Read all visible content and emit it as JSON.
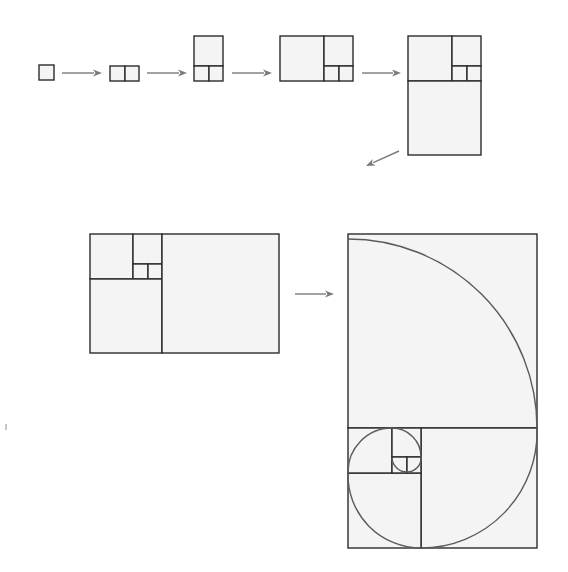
{
  "diagram": {
    "colors": {
      "fill": "#f4f4f4",
      "stroke": "#2b2b2b",
      "arrow": "#7a7a7a",
      "spiral": "#5a5a5a"
    },
    "unit_px": 14.9,
    "stages": [
      {
        "id": "stage-1",
        "label": "1x1",
        "squares": [
          {
            "x": 39,
            "y": 65,
            "w": 15,
            "h": 15
          }
        ]
      },
      {
        "id": "stage-2",
        "label": "1x2",
        "squares": [
          {
            "x": 110,
            "y": 66,
            "w": 15,
            "h": 15
          },
          {
            "x": 125,
            "y": 66,
            "w": 14,
            "h": 15
          }
        ]
      },
      {
        "id": "stage-3",
        "label": "2x3",
        "squares": [
          {
            "x": 194,
            "y": 36,
            "w": 29,
            "h": 30
          },
          {
            "x": 194,
            "y": 66,
            "w": 15,
            "h": 15
          },
          {
            "x": 209,
            "y": 66,
            "w": 14,
            "h": 15
          }
        ]
      },
      {
        "id": "stage-4",
        "label": "3x5",
        "squares": [
          {
            "x": 280,
            "y": 36,
            "w": 44,
            "h": 45
          },
          {
            "x": 324,
            "y": 36,
            "w": 29,
            "h": 30
          },
          {
            "x": 324,
            "y": 66,
            "w": 15,
            "h": 15
          },
          {
            "x": 339,
            "y": 66,
            "w": 14,
            "h": 15
          }
        ]
      },
      {
        "id": "stage-5",
        "label": "5x8",
        "squares": [
          {
            "x": 408,
            "y": 36,
            "w": 44,
            "h": 45
          },
          {
            "x": 452,
            "y": 36,
            "w": 29,
            "h": 30
          },
          {
            "x": 452,
            "y": 66,
            "w": 15,
            "h": 15
          },
          {
            "x": 467,
            "y": 66,
            "w": 14,
            "h": 15
          },
          {
            "x": 408,
            "y": 81,
            "w": 73,
            "h": 74
          }
        ]
      },
      {
        "id": "stage-6",
        "label": "8x13",
        "squares": [
          {
            "x": 90,
            "y": 234,
            "w": 43,
            "h": 45
          },
          {
            "x": 133,
            "y": 234,
            "w": 29,
            "h": 30
          },
          {
            "x": 133,
            "y": 264,
            "w": 15,
            "h": 15
          },
          {
            "x": 148,
            "y": 264,
            "w": 14,
            "h": 15
          },
          {
            "x": 90,
            "y": 279,
            "w": 72,
            "h": 74
          },
          {
            "x": 162,
            "y": 234,
            "w": 117,
            "h": 119
          }
        ]
      },
      {
        "id": "stage-7",
        "label": "13x21 with golden spiral",
        "squares": [
          {
            "x": 348,
            "y": 234,
            "w": 189,
            "h": 194
          },
          {
            "x": 421,
            "y": 428,
            "w": 116,
            "h": 120
          },
          {
            "x": 348,
            "y": 473,
            "w": 73,
            "h": 75
          },
          {
            "x": 348,
            "y": 428,
            "w": 44,
            "h": 45
          },
          {
            "x": 392,
            "y": 428,
            "w": 29,
            "h": 29
          },
          {
            "x": 392,
            "y": 457,
            "w": 15,
            "h": 16
          },
          {
            "x": 407,
            "y": 457,
            "w": 14,
            "h": 16
          }
        ],
        "spiral": [
          {
            "cx": 348,
            "cy": 428,
            "r": 189,
            "from": "top",
            "to": "right",
            "sx": 348,
            "sy": 239,
            "ex": 537,
            "ey": 428
          },
          {
            "cx": 421,
            "cy": 428,
            "r": 116,
            "from": "right",
            "to": "bottom",
            "sx": 537,
            "sy": 428,
            "ex": 421,
            "ey": 548
          },
          {
            "cx": 421,
            "cy": 473,
            "r": 73,
            "from": "bottom",
            "to": "left",
            "sx": 421,
            "sy": 548,
            "ex": 348,
            "ey": 473
          },
          {
            "cx": 392,
            "cy": 473,
            "r": 44,
            "from": "left",
            "to": "top",
            "sx": 348,
            "sy": 473,
            "ex": 392,
            "ey": 428
          },
          {
            "cx": 392,
            "cy": 457,
            "r": 29,
            "from": "top",
            "to": "right",
            "sx": 392,
            "sy": 428,
            "ex": 421,
            "ey": 457
          },
          {
            "cx": 407,
            "cy": 457,
            "r": 14,
            "from": "right",
            "to": "bottom",
            "sx": 421,
            "sy": 457,
            "ex": 407,
            "ey": 472
          },
          {
            "cx": 407,
            "cy": 458,
            "r": 15,
            "from": "bottom",
            "to": "left",
            "sx": 407,
            "sy": 473,
            "ex": 392,
            "ey": 458
          }
        ]
      }
    ],
    "arrows": [
      {
        "id": "arrow-1-2",
        "x1": 62,
        "y1": 73,
        "x2": 102,
        "y2": 73
      },
      {
        "id": "arrow-2-3",
        "x1": 147,
        "y1": 73,
        "x2": 187,
        "y2": 73
      },
      {
        "id": "arrow-3-4",
        "x1": 232,
        "y1": 73,
        "x2": 272,
        "y2": 73
      },
      {
        "id": "arrow-4-5",
        "x1": 362,
        "y1": 73,
        "x2": 401,
        "y2": 73
      },
      {
        "id": "arrow-5-6",
        "x1": 399,
        "y1": 151,
        "x2": 366,
        "y2": 166
      },
      {
        "id": "arrow-6-7",
        "x1": 295,
        "y1": 294,
        "x2": 334,
        "y2": 294
      }
    ],
    "stray_mark": {
      "x": 5,
      "y": 424,
      "w": 2,
      "h": 6
    }
  }
}
